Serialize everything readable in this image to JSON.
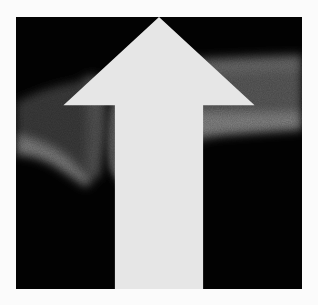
{
  "image": {
    "subject": "radiograph of finger joint",
    "background_color": "#fbfbfb",
    "film_color": "#030303",
    "bone_color": "#7a7a7a",
    "arrow_color": "#e6e6e6",
    "annotations": [
      {
        "type": "arrow",
        "direction": "up",
        "label": ""
      }
    ]
  }
}
